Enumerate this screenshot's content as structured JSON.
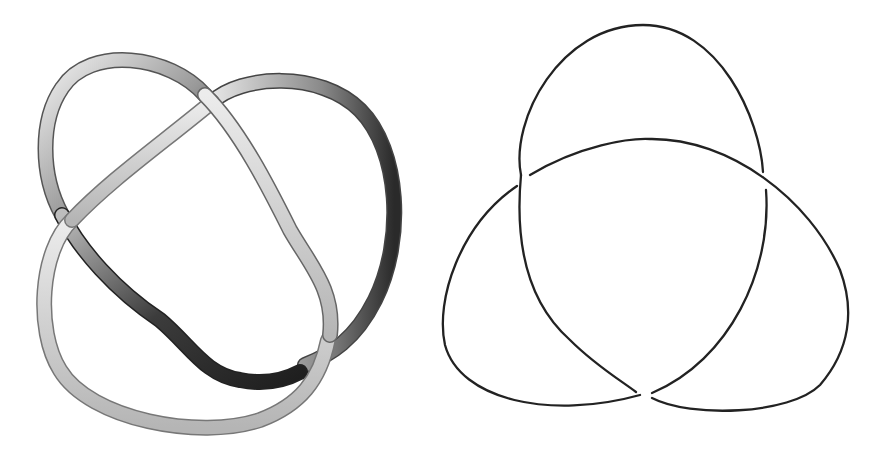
{
  "figure": {
    "panels": [
      {
        "id": "left",
        "description": "3D rendered tube knot (trefoil-like) with grey shading",
        "style": {
          "tube_light": "#f2f2f2",
          "tube_mid": "#a8a8a8",
          "tube_dark": "#3a3a3a"
        }
      },
      {
        "id": "right",
        "description": "Trefoil knot diagram drawn as line with crossing gaps",
        "style": {
          "stroke": "#222222",
          "stroke_width": 2.3
        }
      }
    ]
  }
}
